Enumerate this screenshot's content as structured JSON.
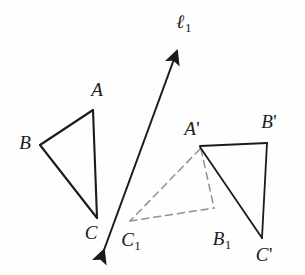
{
  "figure": {
    "background_color": "#fefefe",
    "stroke_color": "#1b1b1b",
    "dashed_color": "#8d8d8d",
    "width": 305,
    "height": 275
  },
  "line": {
    "name": "ell-1",
    "label": "ℓ",
    "subscript": "1",
    "start": {
      "x": 103,
      "y": 253
    },
    "end": {
      "x": 178,
      "y": 48
    },
    "double_headed": true,
    "label_position": {
      "x": 184,
      "y": 22
    }
  },
  "triangles": [
    {
      "name": "triangle-abc",
      "style": "solid",
      "color": "#1b1b1b",
      "vertices": [
        {
          "label": "A",
          "prime": false,
          "subscript": "",
          "x": 93,
          "y": 110,
          "label_x": 97,
          "label_y": 89
        },
        {
          "label": "B",
          "prime": false,
          "subscript": "",
          "x": 40,
          "y": 145,
          "label_x": 25,
          "label_y": 142
        },
        {
          "label": "C",
          "prime": false,
          "subscript": "",
          "x": 97,
          "y": 218,
          "label_x": 91,
          "label_y": 232
        }
      ]
    },
    {
      "name": "triangle-a1b1c1",
      "style": "dashed",
      "color": "#8d8d8d",
      "vertices": [
        {
          "label": "A",
          "prime": true,
          "subscript": "",
          "x": 200,
          "y": 147,
          "label_x": 192,
          "label_y": 128
        },
        {
          "label": "B",
          "prime": false,
          "subscript": "1",
          "x": 214,
          "y": 208,
          "label_x": 222,
          "label_y": 240
        },
        {
          "label": "C",
          "prime": false,
          "subscript": "1",
          "x": 130,
          "y": 222,
          "label_x": 131,
          "label_y": 241
        }
      ]
    },
    {
      "name": "triangle-a-prime-b-prime-c-prime",
      "style": "solid",
      "color": "#1b1b1b",
      "vertices": [
        {
          "label": "A",
          "prime": true,
          "subscript": "",
          "x": 200,
          "y": 147,
          "label_x": 192,
          "label_y": 128
        },
        {
          "label": "B",
          "prime": true,
          "subscript": "",
          "x": 267,
          "y": 143,
          "label_x": 269,
          "label_y": 121
        },
        {
          "label": "C",
          "prime": true,
          "subscript": "",
          "x": 262,
          "y": 238,
          "label_x": 264,
          "label_y": 254
        }
      ]
    }
  ],
  "labels": [
    {
      "name": "label-A",
      "text": "A",
      "prime": "",
      "sub": "",
      "x": 97,
      "y": 89
    },
    {
      "name": "label-B",
      "text": "B",
      "prime": "",
      "sub": "",
      "x": 25,
      "y": 142
    },
    {
      "name": "label-C",
      "text": "C",
      "prime": "",
      "sub": "",
      "x": 91,
      "y": 232
    },
    {
      "name": "label-C1",
      "text": "C",
      "prime": "",
      "sub": "1",
      "x": 131,
      "y": 241
    },
    {
      "name": "label-B1",
      "text": "B",
      "prime": "",
      "sub": "1",
      "x": 222,
      "y": 240
    },
    {
      "name": "label-A-prime",
      "text": "A",
      "prime": "'",
      "sub": "",
      "x": 192,
      "y": 128
    },
    {
      "name": "label-B-prime",
      "text": "B",
      "prime": "'",
      "sub": "",
      "x": 269,
      "y": 121
    },
    {
      "name": "label-C-prime",
      "text": "C",
      "prime": "'",
      "sub": "",
      "x": 264,
      "y": 254
    }
  ]
}
